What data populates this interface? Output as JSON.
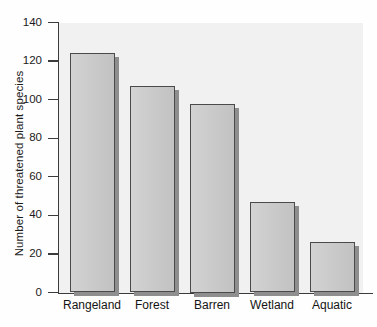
{
  "chart_data": {
    "type": "bar",
    "title": "",
    "subtitle": "",
    "xlabel": "",
    "ylabel": "Number of threatened plant species",
    "categories": [
      "Rangeland",
      "Forest",
      "Barren",
      "Wetland",
      "Aquatic"
    ],
    "values": [
      124,
      107,
      98,
      47,
      26
    ],
    "series": [
      {
        "name": "Threatened plant species",
        "values": [
          124,
          107,
          98,
          47,
          26
        ]
      }
    ],
    "ylim": [
      0,
      140
    ],
    "yticks": [
      0,
      20,
      40,
      60,
      80,
      100,
      120,
      140
    ],
    "ytick_labels": [
      "0",
      "20",
      "40",
      "60",
      "80",
      "100",
      "120",
      "140"
    ],
    "grid": false,
    "legend": false,
    "legend_position": "none",
    "annotations": [],
    "style": {
      "bar_fill": "#cccccc",
      "bar_edge": "#4a4a4a",
      "bar_shadow": "#8e8e8e",
      "plot_background": "#f1f1f1",
      "figure_background": "#fefefe",
      "axis_color": "#3b3b3b",
      "text_color": "#141414"
    }
  }
}
